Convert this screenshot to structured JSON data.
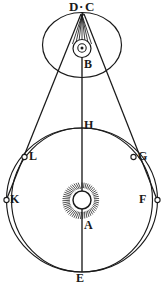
{
  "figure": {
    "background_color": "#ffffff",
    "ink_color": "#1a1a1a",
    "labels": {
      "d": "D",
      "dc_separator": "·",
      "c": "C",
      "b": "B",
      "h": "H",
      "g": "G",
      "l": "L",
      "k": "K",
      "f": "F",
      "a": "A",
      "e": "E"
    },
    "label_positions": {
      "d": {
        "x": 71,
        "y": 1
      },
      "dc_separator": {
        "x": 80,
        "y": 1
      },
      "c": {
        "x": 85,
        "y": 1
      },
      "b": {
        "x": 80,
        "y": 60
      },
      "h": {
        "x": 81,
        "y": 120
      },
      "l": {
        "x": 29,
        "y": 151
      },
      "g": {
        "x": 139,
        "y": 151
      },
      "k": {
        "x": 9,
        "y": 192
      },
      "f": {
        "x": 138,
        "y": 192
      },
      "a": {
        "x": 80,
        "y": 220
      },
      "e": {
        "x": 76,
        "y": 271
      }
    },
    "elements": {
      "upper_circle": {
        "name": "epicycle-circle",
        "cx": 82,
        "cy": 45,
        "rx": 40,
        "ry": 33
      },
      "b_outer_circle": {
        "name": "b-outer-circle",
        "cx": 82,
        "cy": 49,
        "r": 9
      },
      "b_inner_circle": {
        "name": "b-inner-circle",
        "cx": 82,
        "cy": 48,
        "r": 4
      },
      "b_dot": {
        "name": "b-center-dot",
        "cx": 82,
        "cy": 48,
        "r": 1.6
      },
      "apex": {
        "name": "dc-apex-point",
        "x": 82,
        "y": 14
      },
      "sun": {
        "name": "sun-symbol",
        "cx": 82,
        "cy": 200,
        "r": 9,
        "ray_count": 52
      },
      "orbit_inner": {
        "name": "orbit-inner-circle",
        "cx": 82,
        "cy": 200,
        "rx": 71,
        "ry": 72
      },
      "orbit_outer": {
        "name": "orbit-outer-circle",
        "cx": 82,
        "cy": 200,
        "rx": 76,
        "ry": 72
      },
      "axis_line": {
        "name": "vertical-axis-line",
        "x": 82,
        "y1": 48,
        "y2": 272
      },
      "point_h": {
        "cx": 82,
        "cy": 128
      },
      "point_e": {
        "cx": 82,
        "cy": 272
      },
      "point_l": {
        "cx": 24,
        "cy": 157
      },
      "point_g": {
        "cx": 134,
        "cy": 157
      },
      "point_k": {
        "cx": 6,
        "cy": 200
      },
      "point_f": {
        "cx": 157,
        "cy": 200
      },
      "ray_count_apex": 7
    }
  }
}
